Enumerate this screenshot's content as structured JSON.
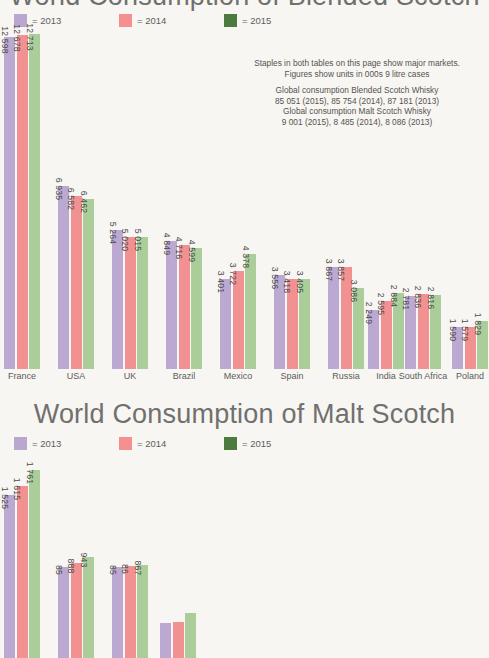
{
  "page": {
    "background_color": "#f8f6f2",
    "title_color": "#70706e"
  },
  "colors": {
    "bar_2013": "#bca9d2",
    "bar_2014": "#f19191",
    "bar_2015": "#aacd99",
    "legend_2013": "#bba6d0",
    "legend_2014": "#f4918f",
    "legend_2015": "#4d7a3e"
  },
  "chart1": {
    "title": "World Consumption of Blended Scotch",
    "legend": [
      {
        "label": "= 2013",
        "color": "#bba6d0"
      },
      {
        "label": "= 2014",
        "color": "#f4918f"
      },
      {
        "label": "= 2015",
        "color": "#4d7a3e"
      }
    ]
  },
  "note": {
    "line1": "Staples in both tables on this page show major markets.",
    "line2": "Figures show units in 000s 9 litre cases",
    "line3": "Global consumption Blended Scotch Whisky",
    "line4": "85 051 (2015), 85 754 (2014), 87 181 (2013)",
    "line5": "Global consumption Malt Scotch Whisky",
    "line6": "9 001 (2015), 8 485 (2014), 8 086 (2013)"
  },
  "chart2": {
    "title": "World Consumption of Malt Scotch",
    "legend": [
      {
        "label": "= 2013",
        "color": "#bba6d0"
      },
      {
        "label": "= 2014",
        "color": "#f4918f"
      },
      {
        "label": "= 2015",
        "color": "#4d7a3e"
      }
    ]
  },
  "chart_data": [
    {
      "type": "bar",
      "title": "World Consumption of Blended Scotch",
      "xlabel": "",
      "ylabel": "",
      "ylim": [
        0,
        12713
      ],
      "grid": false,
      "legend_position": "top-left",
      "categories": [
        "France",
        "USA",
        "UK",
        "Brazil",
        "Mexico",
        "Spain",
        "Russia",
        "India",
        "South Africa",
        "Poland"
      ],
      "series": [
        {
          "name": "2013",
          "color": "#bca9d2",
          "values": [
            12598,
            6935,
            5264,
            4849,
            3401,
            3556,
            3867,
            2249,
            2781,
            1590
          ],
          "labels": [
            "12 598",
            "6 935",
            "5 264",
            "4 849",
            "3 401",
            "3 556",
            "3 867",
            "2 249",
            "2 781",
            "1 590"
          ]
        },
        {
          "name": "2014",
          "color": "#f19191",
          "values": [
            12678,
            6582,
            5020,
            4716,
            3722,
            3418,
            3857,
            2595,
            2836,
            1579
          ],
          "labels": [
            "12 678",
            "6 582",
            "5 020",
            "4 716",
            "3 722",
            "3 418",
            "3 857",
            "2 595",
            "2 836",
            "1 579"
          ]
        },
        {
          "name": "2015",
          "color": "#aacd99",
          "values": [
            12713,
            6462,
            5015,
            4599,
            4378,
            3405,
            3086,
            2884,
            2816,
            1829
          ],
          "labels": [
            "12 713",
            "6 462",
            "5 015",
            "4 599",
            "4 378",
            "3 405",
            "3 086",
            "2 884",
            "2 816",
            "1 829"
          ]
        }
      ]
    },
    {
      "type": "bar",
      "title": "World Consumption of Malt Scotch",
      "xlabel": "",
      "ylabel": "",
      "ylim": [
        0,
        1761
      ],
      "grid": false,
      "legend_position": "top-left",
      "note": "Chart is cropped at the bottom edge of the screenshot; category labels are not visible and later bar labels are clipped.",
      "categories": [
        "",
        "",
        "",
        ""
      ],
      "series": [
        {
          "name": "2013",
          "color": "#bca9d2",
          "values": [
            1525,
            850,
            850,
            330
          ],
          "labels": [
            "1 525",
            "85",
            "85",
            ""
          ]
        },
        {
          "name": "2014",
          "color": "#f19191",
          "values": [
            1615,
            888,
            860,
            340
          ],
          "labels": [
            "1 615",
            "888",
            "86",
            ""
          ]
        },
        {
          "name": "2015",
          "color": "#aacd99",
          "values": [
            1761,
            943,
            867,
            420
          ],
          "labels": [
            "1 761",
            "943",
            "867",
            ""
          ]
        }
      ]
    }
  ]
}
